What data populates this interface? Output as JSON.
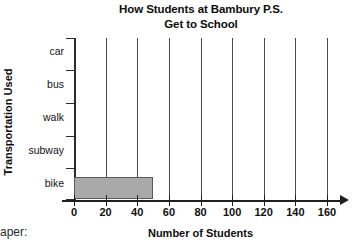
{
  "chart_data": {
    "type": "bar",
    "orientation": "horizontal",
    "title": "How Students at Bambury P.S. Get to School",
    "title_line1": "How Students at Bambury P.S.",
    "title_line2": "Get to School",
    "xlabel": "Number of Students",
    "ylabel": "Transportation Used",
    "categories": [
      "car",
      "bus",
      "walk",
      "subway",
      "bike"
    ],
    "values": [
      0,
      0,
      0,
      0,
      50
    ],
    "xlim": [
      0,
      160
    ],
    "xticks": [
      0,
      20,
      40,
      60,
      80,
      100,
      120,
      140,
      160
    ],
    "xtick_labels": [
      "0",
      "20",
      "40",
      "60",
      "80",
      "100",
      "120",
      "140",
      "160"
    ],
    "grid": "vertical",
    "legend": "none",
    "bar_fill_color": "#a9a9a9",
    "bar_border_color": "#5a5a5a",
    "axis_color": "#1f1f1f",
    "gridline_color": "#4a4a4a"
  },
  "caption": {
    "clipped_text": "aper:"
  }
}
